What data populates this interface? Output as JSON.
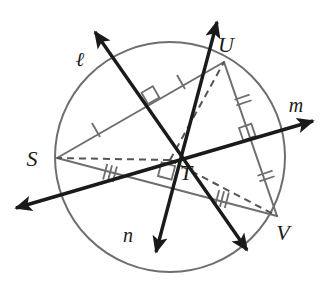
{
  "figure": {
    "background_color": "#ffffff",
    "circle": {
      "name": "circle-T",
      "cx": 170,
      "cy": 157,
      "r": 115,
      "stroke_color": "#6e6e6e",
      "stroke_width": 2
    },
    "points": [
      {
        "id": "S",
        "label": "S",
        "label_x": 32,
        "label_y": 166,
        "x": 57,
        "y": 158
      },
      {
        "id": "U",
        "label": "U",
        "label_x": 226,
        "label_y": 52,
        "x": 224,
        "y": 62
      },
      {
        "id": "V",
        "label": "V",
        "label_x": 283,
        "label_y": 240,
        "x": 277,
        "y": 216
      },
      {
        "id": "T",
        "label": "T",
        "label_x": 186,
        "label_y": 180,
        "x": 170,
        "y": 160
      }
    ],
    "chords": [
      {
        "name": "chord-SU",
        "from": "S",
        "to": "U",
        "color": "#6e6e6e",
        "ticks": 1
      },
      {
        "name": "chord-UV",
        "from": "U",
        "to": "V",
        "color": "#6e6e6e",
        "ticks": 2
      },
      {
        "name": "chord-SV",
        "from": "S",
        "to": "V",
        "color": "#6e6e6e",
        "ticks": 3
      }
    ],
    "radii": [
      {
        "name": "radius-TS",
        "from": "T",
        "to": "S",
        "style": "dashed",
        "color": "#555555"
      },
      {
        "name": "radius-TU",
        "from": "T",
        "to": "U",
        "style": "dashed",
        "color": "#555555"
      },
      {
        "name": "radius-TV",
        "from": "T",
        "to": "V",
        "style": "dashed",
        "color": "#555555"
      }
    ],
    "lines": [
      {
        "id": "l",
        "label": "ℓ",
        "label_x": 80,
        "label_y": 66,
        "color": "#1a1a1a",
        "x1": 95,
        "y1": 32,
        "x2": 247,
        "y2": 250,
        "arrow_start": true,
        "arrow_end": true,
        "description": "perpendicular bisector of chord SU"
      },
      {
        "id": "m",
        "label": "m",
        "label_x": 296,
        "label_y": 112,
        "color": "#1a1a1a",
        "x1": 313,
        "y1": 121,
        "x2": 16,
        "y2": 208,
        "arrow_start": true,
        "arrow_end": true,
        "description": "perpendicular bisector of chord UV"
      },
      {
        "id": "n",
        "label": "n",
        "label_x": 128,
        "label_y": 242,
        "color": "#1a1a1a",
        "x1": 217,
        "y1": 22,
        "x2": 156,
        "y2": 252,
        "arrow_start": true,
        "arrow_end": true,
        "description": "perpendicular bisector of chord SV"
      }
    ],
    "right_angle_marks": [
      {
        "name": "right-angle-l-SU",
        "x": 148,
        "y": 104,
        "at_chord": "SU",
        "at_line": "l"
      },
      {
        "name": "right-angle-m-UV",
        "x": 239,
        "y": 128,
        "at_chord": "UV",
        "at_line": "m"
      },
      {
        "name": "right-angle-n-SV",
        "x": 158,
        "y": 176,
        "at_chord": "SV",
        "at_line": "n"
      }
    ],
    "tick_marks": [
      {
        "name": "tick-SU-near-S",
        "chord": "SU",
        "count": 1,
        "x": 96,
        "y": 130
      },
      {
        "name": "tick-SU-near-U",
        "chord": "SU",
        "count": 1,
        "x": 181,
        "y": 82
      },
      {
        "name": "tick-UV-near-U",
        "chord": "UV",
        "count": 2,
        "x": 243,
        "y": 100
      },
      {
        "name": "tick-UV-near-V",
        "chord": "UV",
        "count": 2,
        "x": 266,
        "y": 176
      },
      {
        "name": "tick-SV-near-S",
        "chord": "SV",
        "count": 3,
        "x": 110,
        "y": 173
      },
      {
        "name": "tick-SV-near-V",
        "chord": "SV",
        "count": 3,
        "x": 222,
        "y": 199
      }
    ]
  }
}
